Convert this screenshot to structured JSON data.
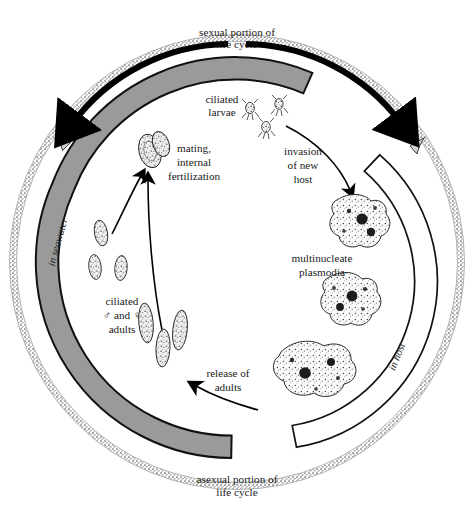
{
  "figure": {
    "background_color": "#ffffff",
    "width": 474,
    "height": 520
  },
  "colors": {
    "band_gray": "#9a9a9a",
    "band_gray_stroke": "#111111",
    "band_white": "#ffffff",
    "outline": "#111111",
    "stipple_ring": "#6d6d6d",
    "text": "#1a1a1a",
    "arrow_thick": "#000000"
  },
  "labels": {
    "sexual_portion": {
      "line1": "sexual portion of",
      "line2": "life cycle"
    },
    "asexual_portion": {
      "line1": "asexual portion of",
      "line2": "life cycle"
    },
    "ciliated_larvae": {
      "line1": "ciliated",
      "line2": "larvae"
    },
    "mating": {
      "line1": "mating,",
      "line2": "internal",
      "line3": "fertilization"
    },
    "invasion": {
      "line1": "invasion",
      "line2": "of new",
      "line3": "host"
    },
    "multinucleate_plasmodia": {
      "line1": "multinucleate",
      "line2": "plasmodia"
    },
    "ciliated_adults": {
      "line1": "ciliated",
      "line2": "♂ and ♀",
      "line3": "adults"
    },
    "release_of_adults": {
      "line1": "release of",
      "line2": "adults"
    },
    "in_seawater": "in seawater",
    "in_host": "in host"
  },
  "organisms": {
    "larvae_count": 3,
    "mating_pair_count": 1,
    "juvenile_count": 2,
    "adult_count": 3,
    "plasmodia_count": 3,
    "larva_name": "ciliated larva",
    "adult_name": "ciliated adult",
    "plasmodium_name": "multinucleate plasmodium",
    "mating_pair_name": "mating pair"
  },
  "bands": {
    "seawater_band": "in seawater",
    "host_band": "in host"
  },
  "arrows": {
    "sexual_arc": "sexual portion of life cycle arc arrow",
    "asexual_arc": "asexual portion of life cycle arc arrow",
    "invasion_arrow": "invasion of new host arrow",
    "release_arrow": "release of adults arrow",
    "mating_arrow_left": "adults to mating arrow",
    "mating_arrow_right": "adults to mating arrow"
  }
}
